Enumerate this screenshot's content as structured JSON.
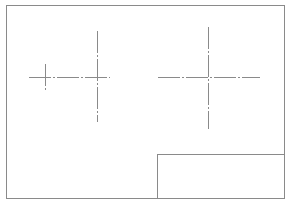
{
  "sheet": {
    "width": 290,
    "height": 204,
    "background": "#ffffff",
    "line_color": "#8a8a8a",
    "border": {
      "x1": 6,
      "y1": 5,
      "x2": 284,
      "y2": 198
    },
    "title_block": {
      "x1": 157,
      "y1": 154,
      "x2": 284,
      "y2": 198
    }
  },
  "center_marks": [
    {
      "name": "center-mark-left-small",
      "cx": 45,
      "cy": 77,
      "h": {
        "x1": 29,
        "x2": 110
      },
      "v": {
        "y1": 64,
        "y2": 92
      }
    },
    {
      "name": "center-mark-left-large",
      "cx": 97,
      "cy": 77,
      "h": {
        "x1": 29,
        "x2": 110
      },
      "v": {
        "y1": 31,
        "y2": 122
      }
    },
    {
      "name": "center-mark-right",
      "cx": 208,
      "cy": 77,
      "h": {
        "x1": 158,
        "x2": 260
      },
      "v": {
        "y1": 27,
        "y2": 129
      }
    }
  ],
  "centerline_dash": "22,2,2,2"
}
